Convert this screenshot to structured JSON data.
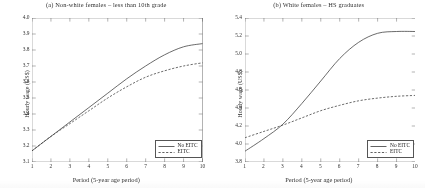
{
  "figure": {
    "panels": [
      {
        "id": "panel-a",
        "title": "(a) Non-white females – less than 10th grade",
        "xlabel": "Period (5-year age period)",
        "ylabel": "Hourly wage (US$)",
        "yticks": [
          "4.0",
          "3.9",
          "3.8",
          "3.7",
          "3.6",
          "3.5",
          "3.4",
          "3.3",
          "3.2",
          "3.1"
        ],
        "xticks": [
          "1",
          "2",
          "3",
          "4",
          "5",
          "6",
          "7",
          "8",
          "9",
          "10"
        ],
        "legend": [
          {
            "label": "No EITC",
            "style": "solid"
          },
          {
            "label": "EITC",
            "style": "dashed"
          }
        ]
      },
      {
        "id": "panel-b",
        "title": "(b) White females – HS graduates",
        "xlabel": "Period (5-year age period)",
        "ylabel": "Hourly wage (US$)",
        "yticks": [
          "5.4",
          "5.2",
          "5.0",
          "4.8",
          "4.6",
          "4.4",
          "4.2",
          "4.0",
          "3.8"
        ],
        "xticks": [
          "1",
          "2",
          "3",
          "4",
          "5",
          "6",
          "7",
          "8",
          "9",
          "10"
        ],
        "legend": [
          {
            "label": "No EITC",
            "style": "solid"
          },
          {
            "label": "EITC",
            "style": "dashed"
          }
        ]
      }
    ],
    "colors": {
      "line": "#3a3a3a",
      "axis": "#555555",
      "background": "#ffffff"
    }
  },
  "chart_data": [
    {
      "type": "line",
      "panel": "a",
      "title": "(a) Non-white females – less than 10th grade",
      "xlabel": "Period (5-year age period)",
      "ylabel": "Hourly wage (US$)",
      "xlim": [
        1,
        10
      ],
      "ylim": [
        3.1,
        4.0
      ],
      "ytick_step": 0.1,
      "grid": false,
      "legend_position": "lower right",
      "x": [
        1,
        2,
        3,
        4,
        5,
        6,
        7,
        8,
        9,
        10
      ],
      "series": [
        {
          "name": "No EITC",
          "style": "solid",
          "values": [
            3.17,
            3.26,
            3.35,
            3.44,
            3.53,
            3.62,
            3.7,
            3.77,
            3.82,
            3.84
          ]
        },
        {
          "name": "EITC",
          "style": "dashed",
          "values": [
            3.17,
            3.26,
            3.34,
            3.42,
            3.5,
            3.57,
            3.63,
            3.67,
            3.7,
            3.72
          ]
        }
      ]
    },
    {
      "type": "line",
      "panel": "b",
      "title": "(b) White females – HS graduates",
      "xlabel": "Period (5-year age period)",
      "ylabel": "Hourly wage (US$)",
      "xlim": [
        1,
        10
      ],
      "ylim": [
        3.8,
        5.4
      ],
      "ytick_step": 0.2,
      "grid": false,
      "legend_position": "lower right",
      "x": [
        1,
        2,
        3,
        4,
        5,
        6,
        7,
        8,
        9,
        10
      ],
      "series": [
        {
          "name": "No EITC",
          "style": "solid",
          "values": [
            3.92,
            4.06,
            4.22,
            4.45,
            4.7,
            4.95,
            5.13,
            5.23,
            5.25,
            5.25
          ]
        },
        {
          "name": "EITC",
          "style": "dashed",
          "values": [
            4.07,
            4.14,
            4.21,
            4.29,
            4.37,
            4.43,
            4.48,
            4.51,
            4.53,
            4.54
          ]
        }
      ]
    }
  ]
}
